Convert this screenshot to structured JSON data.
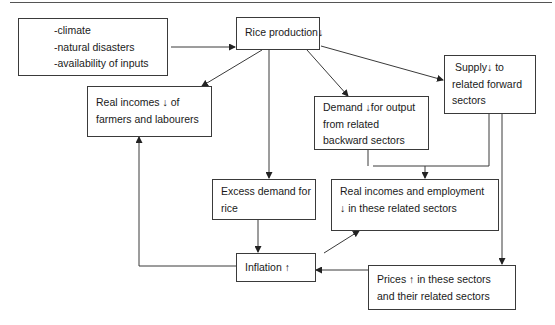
{
  "diagram": {
    "type": "flowchart",
    "nodes": {
      "causes": {
        "lines": [
          "-climate",
          "-natural disasters",
          "-availability of inputs"
        ]
      },
      "rice_production": {
        "lines": [
          "Rice production↓"
        ]
      },
      "farmer_incomes": {
        "lines": [
          "Real incomes ↓ of",
          "farmers and labourers"
        ]
      },
      "backward_demand": {
        "lines": [
          "Demand ↓for output",
          "from related",
          "backward sectors"
        ]
      },
      "forward_supply": {
        "lines": [
          " Supply↓ to",
          "related forward",
          "sectors"
        ]
      },
      "excess_demand": {
        "lines": [
          "Excess demand for",
          "rice"
        ]
      },
      "related_incomes": {
        "lines": [
          "Real incomes and employment",
          "↓ in these related sectors"
        ]
      },
      "inflation": {
        "lines": [
          "Inflation ↑"
        ]
      },
      "prices": {
        "lines": [
          "Prices ↑ in these sectors",
          "and their related sectors"
        ]
      }
    },
    "edges": [
      {
        "from": "causes",
        "to": "rice_production"
      },
      {
        "from": "rice_production",
        "to": "farmer_incomes"
      },
      {
        "from": "rice_production",
        "to": "backward_demand"
      },
      {
        "from": "rice_production",
        "to": "forward_supply"
      },
      {
        "from": "rice_production",
        "to": "excess_demand"
      },
      {
        "from": "backward_demand",
        "to": "related_incomes"
      },
      {
        "from": "forward_supply",
        "to": "related_incomes"
      },
      {
        "from": "forward_supply",
        "to": "prices"
      },
      {
        "from": "excess_demand",
        "to": "inflation"
      },
      {
        "from": "inflation",
        "to": "farmer_incomes"
      },
      {
        "from": "inflation",
        "to": "related_incomes"
      },
      {
        "from": "prices",
        "to": "inflation"
      }
    ],
    "colors": {
      "stroke": "#3a3a3a",
      "text": "#1a1a1a",
      "background": "#ffffff"
    }
  }
}
